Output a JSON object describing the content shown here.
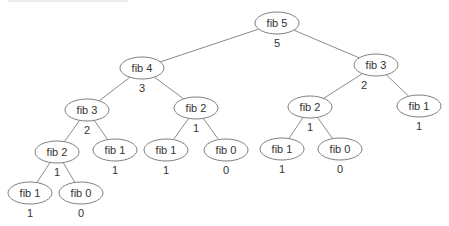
{
  "colors": {
    "edge": "#8c8c8c",
    "ellipse_stroke": "#7f7f7f",
    "text": "#333333",
    "background": "#ffffff"
  },
  "nodes": [
    {
      "id": "n0",
      "label": "fib 5",
      "value": "5",
      "x": 277,
      "y": 23
    },
    {
      "id": "n1",
      "label": "fib 4",
      "value": "3",
      "x": 142,
      "y": 68
    },
    {
      "id": "n2",
      "label": "fib 3",
      "value": "2",
      "x": 376,
      "y": 65,
      "vx": 364
    },
    {
      "id": "n3",
      "label": "fib 3",
      "value": "2",
      "x": 87,
      "y": 110
    },
    {
      "id": "n4",
      "label": "fib 2",
      "value": "1",
      "x": 196,
      "y": 108
    },
    {
      "id": "n5",
      "label": "fib 2",
      "value": "1",
      "x": 310,
      "y": 107
    },
    {
      "id": "n6",
      "label": "fib 1",
      "value": "1",
      "x": 419,
      "y": 106
    },
    {
      "id": "n7",
      "label": "fib 2",
      "value": "1",
      "x": 57,
      "y": 152
    },
    {
      "id": "n8",
      "label": "fib 1",
      "value": "1",
      "x": 115,
      "y": 150
    },
    {
      "id": "n9",
      "label": "fib 1",
      "value": "1",
      "x": 166,
      "y": 150
    },
    {
      "id": "n10",
      "label": "fib 0",
      "value": "0",
      "x": 226,
      "y": 150
    },
    {
      "id": "n11",
      "label": "fib 1",
      "value": "1",
      "x": 282,
      "y": 149
    },
    {
      "id": "n12",
      "label": "fib 0",
      "value": "0",
      "x": 340,
      "y": 149
    },
    {
      "id": "n13",
      "label": "fib 1",
      "value": "1",
      "x": 30,
      "y": 193
    },
    {
      "id": "n14",
      "label": "fib 0",
      "value": "0",
      "x": 81,
      "y": 193
    }
  ],
  "edges": [
    [
      "n0",
      "n1"
    ],
    [
      "n0",
      "n2"
    ],
    [
      "n1",
      "n3"
    ],
    [
      "n1",
      "n4"
    ],
    [
      "n2",
      "n5"
    ],
    [
      "n2",
      "n6"
    ],
    [
      "n3",
      "n7"
    ],
    [
      "n3",
      "n8"
    ],
    [
      "n4",
      "n9"
    ],
    [
      "n4",
      "n10"
    ],
    [
      "n5",
      "n11"
    ],
    [
      "n5",
      "n12"
    ],
    [
      "n7",
      "n13"
    ],
    [
      "n7",
      "n14"
    ]
  ]
}
